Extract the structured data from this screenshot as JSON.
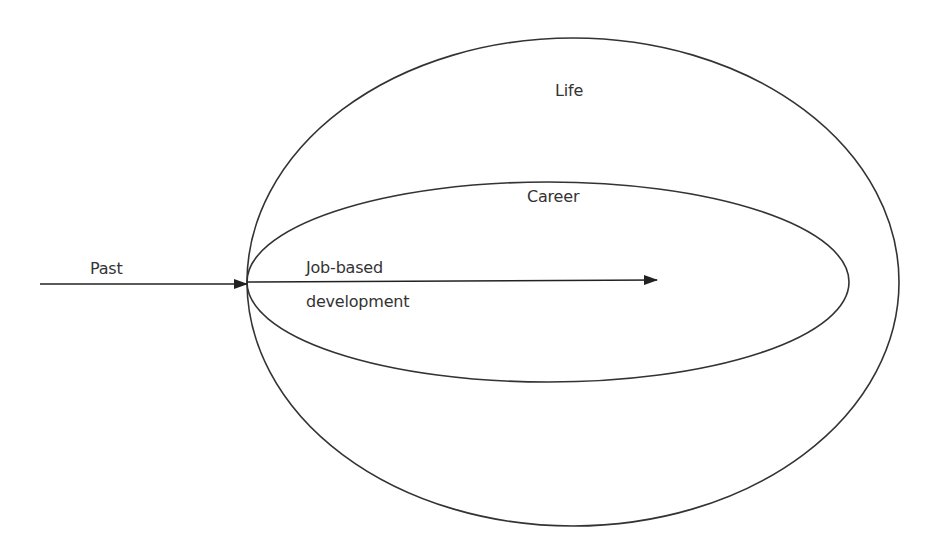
{
  "diagram": {
    "type": "nested-ellipses-with-arrow",
    "stroke_color": "#333333",
    "background": "#ffffff",
    "ellipses": [
      {
        "name": "Life",
        "label": "Life",
        "cx": 573,
        "cy": 282,
        "rx": 326,
        "ry": 244
      },
      {
        "name": "Career",
        "label": "Career",
        "cx": 548,
        "cy": 282,
        "rx": 301,
        "ry": 100
      }
    ],
    "arrows": [
      {
        "name": "past-arrow",
        "label": "Past",
        "x1": 40,
        "y1": 284,
        "x2": 247,
        "y2": 284
      },
      {
        "name": "job-development-arrow",
        "label_line1": "Job-based",
        "label_line2": "development",
        "x1": 247,
        "y1": 282,
        "x2": 657,
        "y2": 280
      }
    ]
  },
  "labels": {
    "life": "Life",
    "career": "Career",
    "past": "Past",
    "job_based": "Job-based",
    "development": "development"
  }
}
